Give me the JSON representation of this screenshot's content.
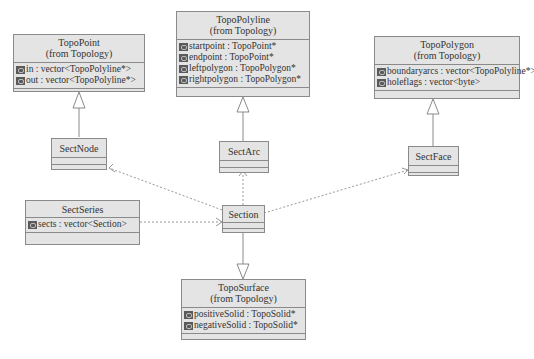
{
  "diagram": {
    "type": "UML class diagram",
    "classes": {
      "topo_point": {
        "name": "TopoPoint",
        "package": "(from Topology)",
        "attributes": [
          {
            "icon": "attribute-icon",
            "text": "in : vector<TopoPolyline*>"
          },
          {
            "icon": "attribute-icon",
            "text": "out : vector<TopoPolyline*>"
          }
        ]
      },
      "topo_polyline": {
        "name": "TopoPolyline",
        "package": "(from Topology)",
        "attributes": [
          {
            "icon": "attribute-icon",
            "text": "startpoint : TopoPoint*"
          },
          {
            "icon": "attribute-icon",
            "text": "endpoint : TopoPoint*"
          },
          {
            "icon": "attribute-icon",
            "text": "leftpolygon : TopoPolygon*"
          },
          {
            "icon": "attribute-icon",
            "text": "rightpolygon : TopoPolygon*"
          }
        ]
      },
      "topo_polygon": {
        "name": "TopoPolygon",
        "package": "(from Topology)",
        "attributes": [
          {
            "icon": "attribute-icon",
            "text": "boundaryarcs : vector<TopoPolyline*>"
          },
          {
            "icon": "attribute-icon",
            "text": "holeflags : vector<byte>"
          }
        ]
      },
      "sect_node": {
        "name": "SectNode"
      },
      "sect_arc": {
        "name": "SectArc"
      },
      "sect_face": {
        "name": "SectFace"
      },
      "sect_series": {
        "name": "SectSeries",
        "attributes": [
          {
            "icon": "attribute-icon",
            "text": "sects : vector<Section>"
          }
        ]
      },
      "section": {
        "name": "Section"
      },
      "topo_surface": {
        "name": "TopoSurface",
        "package": "(from Topology)",
        "attributes": [
          {
            "icon": "attribute-icon",
            "text": "positiveSolid : TopoSolid*"
          },
          {
            "icon": "attribute-icon",
            "text": "negativeSolid : TopoSolid*"
          }
        ]
      }
    },
    "relations": [
      {
        "from": "SectNode",
        "to": "TopoPoint",
        "kind": "generalization"
      },
      {
        "from": "SectArc",
        "to": "TopoPolyline",
        "kind": "generalization"
      },
      {
        "from": "SectFace",
        "to": "TopoPolygon",
        "kind": "generalization"
      },
      {
        "from": "Section",
        "to": "TopoSurface",
        "kind": "generalization"
      },
      {
        "from": "Section",
        "to": "SectNode",
        "kind": "dependency"
      },
      {
        "from": "Section",
        "to": "SectArc",
        "kind": "dependency"
      },
      {
        "from": "Section",
        "to": "SectFace",
        "kind": "dependency"
      },
      {
        "from": "SectSeries",
        "to": "Section",
        "kind": "dependency"
      }
    ],
    "colors": {
      "class_fill": "#e4e4e4",
      "class_border": "#8a8a8a",
      "line": "#8a8a8a"
    }
  }
}
